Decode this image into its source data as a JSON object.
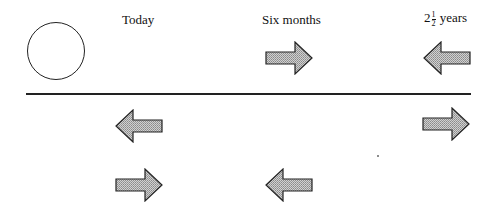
{
  "diagram": {
    "labels": {
      "today": "Today",
      "six_months": "Six months",
      "years_whole": "2",
      "years_num": "1",
      "years_den": "2",
      "years_unit": "years"
    },
    "colors": {
      "arrow_fill": "#b8b8b8",
      "arrow_stroke": "#222222",
      "line": "#222222"
    },
    "arrows": [
      {
        "row": "top",
        "column": "six_months",
        "direction": "right"
      },
      {
        "row": "top",
        "column": "two_and_half_years",
        "direction": "left"
      },
      {
        "row": "middle",
        "column": "today",
        "direction": "left"
      },
      {
        "row": "middle",
        "column": "two_and_half_years",
        "direction": "right"
      },
      {
        "row": "bottom",
        "column": "today",
        "direction": "right"
      },
      {
        "row": "bottom",
        "column": "six_months",
        "direction": "left"
      }
    ]
  }
}
